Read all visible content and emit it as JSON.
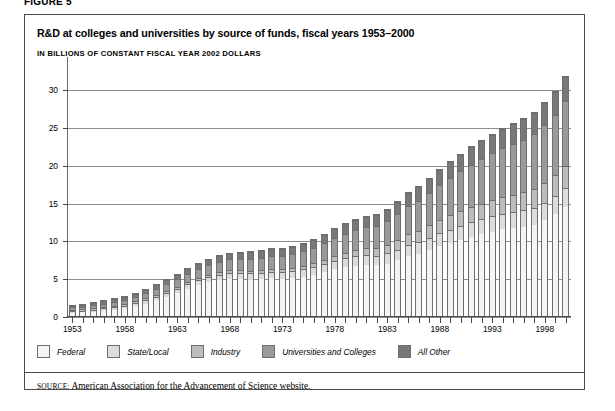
{
  "figure_label": "FIGURE 5",
  "title": "R&D at colleges and universities by source of funds, fiscal years 1953–2000",
  "subtitle": "IN BILLIONS OF CONSTANT FISCAL YEAR 2002 DOLLARS",
  "source": {
    "keyword": "SOURCE:",
    "text": "American Association for the Advancement of Science website."
  },
  "legend": {
    "items": [
      {
        "label": "Federal",
        "color": "#f4f4f4"
      },
      {
        "label": "State/Local",
        "color": "#dcdcdc"
      },
      {
        "label": "Industry",
        "color": "#bdbdbd"
      },
      {
        "label": "Universities and Colleges",
        "color": "#9a9a9a"
      },
      {
        "label": "All Other",
        "color": "#787878"
      }
    ]
  },
  "chart_data": {
    "type": "bar",
    "stacked": true,
    "title": "R&D at colleges and universities by source of funds, fiscal years 1953–2000",
    "subtitle": "IN BILLIONS OF CONSTANT FISCAL YEAR 2002 DOLLARS",
    "xlabel": "",
    "ylabel": "",
    "ylim": [
      0,
      32
    ],
    "yticks": [
      0,
      5,
      10,
      15,
      20,
      25,
      30
    ],
    "grid": true,
    "legend_position": "below",
    "xtick_labels": [
      "1953",
      "1958",
      "1963",
      "1968",
      "1973",
      "1978",
      "1983",
      "1988",
      "1993",
      "1998"
    ],
    "xtick_years": [
      1953,
      1958,
      1963,
      1968,
      1973,
      1978,
      1983,
      1988,
      1993,
      1998
    ],
    "categories": [
      1953,
      1954,
      1955,
      1956,
      1957,
      1958,
      1959,
      1960,
      1961,
      1962,
      1963,
      1964,
      1965,
      1966,
      1967,
      1968,
      1969,
      1970,
      1971,
      1972,
      1973,
      1974,
      1975,
      1976,
      1977,
      1978,
      1979,
      1980,
      1981,
      1982,
      1983,
      1984,
      1985,
      1986,
      1987,
      1988,
      1989,
      1990,
      1991,
      1992,
      1993,
      1994,
      1995,
      1996,
      1997,
      1998,
      1999,
      2000
    ],
    "series": [
      {
        "name": "Federal",
        "values": [
          0.8,
          0.85,
          0.95,
          1.1,
          1.25,
          1.45,
          1.75,
          2.1,
          2.55,
          3.0,
          3.55,
          4.1,
          4.55,
          4.95,
          5.25,
          5.4,
          5.35,
          5.3,
          5.35,
          5.45,
          5.4,
          5.45,
          5.65,
          5.9,
          6.25,
          6.65,
          6.95,
          7.1,
          7.2,
          7.1,
          7.35,
          7.75,
          8.3,
          8.6,
          9.1,
          9.6,
          10.0,
          10.4,
          10.8,
          11.2,
          11.55,
          11.85,
          12.05,
          12.2,
          12.45,
          13.0,
          13.8,
          14.8
        ]
      },
      {
        "name": "State/Local",
        "values": [
          0.2,
          0.22,
          0.24,
          0.26,
          0.28,
          0.3,
          0.34,
          0.38,
          0.42,
          0.46,
          0.5,
          0.55,
          0.6,
          0.64,
          0.68,
          0.72,
          0.74,
          0.76,
          0.78,
          0.8,
          0.82,
          0.85,
          0.9,
          0.95,
          1.0,
          1.05,
          1.1,
          1.15,
          1.2,
          1.22,
          1.28,
          1.35,
          1.45,
          1.52,
          1.6,
          1.68,
          1.75,
          1.82,
          1.88,
          1.92,
          1.96,
          2.0,
          2.05,
          2.1,
          2.15,
          2.22,
          2.3,
          2.4
        ]
      },
      {
        "name": "Industry",
        "values": [
          0.08,
          0.08,
          0.09,
          0.09,
          0.1,
          0.11,
          0.12,
          0.13,
          0.14,
          0.15,
          0.16,
          0.18,
          0.2,
          0.22,
          0.23,
          0.24,
          0.25,
          0.26,
          0.27,
          0.28,
          0.3,
          0.32,
          0.35,
          0.4,
          0.45,
          0.52,
          0.6,
          0.7,
          0.82,
          0.92,
          1.05,
          1.2,
          1.35,
          1.45,
          1.55,
          1.68,
          1.8,
          1.9,
          1.95,
          2.0,
          2.05,
          2.1,
          2.2,
          2.3,
          2.45,
          2.6,
          2.75,
          2.9
        ]
      },
      {
        "name": "Universities and Colleges",
        "values": [
          0.35,
          0.38,
          0.42,
          0.46,
          0.52,
          0.58,
          0.65,
          0.72,
          0.8,
          0.88,
          0.96,
          1.05,
          1.15,
          1.25,
          1.35,
          1.45,
          1.52,
          1.58,
          1.65,
          1.72,
          1.8,
          1.9,
          2.0,
          2.12,
          2.25,
          2.4,
          2.55,
          2.7,
          2.85,
          3.0,
          3.2,
          3.45,
          3.75,
          4.0,
          4.3,
          4.65,
          5.0,
          5.35,
          5.7,
          6.0,
          6.3,
          6.55,
          6.8,
          7.05,
          7.35,
          7.7,
          8.1,
          8.6
        ]
      },
      {
        "name": "All Other",
        "values": [
          0.22,
          0.24,
          0.26,
          0.28,
          0.3,
          0.33,
          0.36,
          0.4,
          0.44,
          0.48,
          0.52,
          0.56,
          0.6,
          0.64,
          0.68,
          0.72,
          0.75,
          0.78,
          0.8,
          0.83,
          0.86,
          0.9,
          0.95,
          1.0,
          1.06,
          1.12,
          1.18,
          1.25,
          1.32,
          1.38,
          1.45,
          1.55,
          1.65,
          1.75,
          1.85,
          1.95,
          2.05,
          2.15,
          2.25,
          2.32,
          2.4,
          2.48,
          2.55,
          2.62,
          2.72,
          2.85,
          3.0,
          3.2
        ]
      }
    ],
    "totals": [
      1.65,
      1.77,
      1.96,
      2.19,
      2.45,
      2.77,
      3.22,
      3.73,
      4.35,
      4.97,
      5.69,
      6.44,
      7.1,
      7.7,
      8.19,
      8.53,
      8.61,
      8.68,
      8.85,
      9.08,
      9.18,
      9.42,
      9.85,
      10.37,
      11.01,
      11.74,
      12.38,
      12.9,
      13.39,
      13.62,
      14.33,
      15.3,
      16.5,
      17.32,
      18.4,
      19.56,
      20.6,
      21.62,
      22.58,
      23.44,
      24.26,
      24.98,
      25.65,
      26.27,
      27.12,
      28.37,
      29.95,
      31.9
    ]
  }
}
